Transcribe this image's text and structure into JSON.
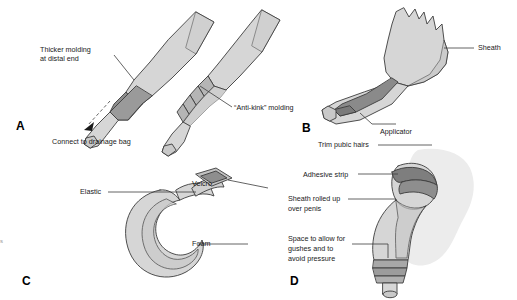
{
  "figure": {
    "background": "#ffffff",
    "style": "grayscale-line-drawing",
    "colors": {
      "outline": "#3c3c3c",
      "light_gray": "#d6d6d6",
      "mid_gray": "#bdbdbd",
      "dark_gray": "#8e8e8e",
      "darker_gray": "#7a7a7a",
      "shadow_gray": "#e6e6e6",
      "label_text": "#1a1a1a"
    },
    "panels": [
      {
        "id": "A",
        "letter": "A",
        "subject": "urinary sheath catheter outlet ends",
        "labels": [
          {
            "name": "thicker-molding",
            "lines": [
              "Thicker molding",
              "at distal end"
            ]
          },
          {
            "name": "anti-kink-molding",
            "lines": [
              "“Anti-kink” molding"
            ]
          },
          {
            "name": "connect-drainage-bag",
            "lines": [
              "Connect to drainage bag"
            ]
          }
        ]
      },
      {
        "id": "B",
        "letter": "B",
        "subject": "sheath with applicator",
        "labels": [
          {
            "name": "sheath",
            "lines": [
              "Sheath"
            ]
          },
          {
            "name": "applicator",
            "lines": [
              "Applicator"
            ]
          }
        ]
      },
      {
        "id": "C",
        "letter": "C",
        "subject": "foam fixing strap",
        "labels": [
          {
            "name": "elastic",
            "lines": [
              "Elastic"
            ]
          },
          {
            "name": "velcro",
            "lines": [
              "Velcro"
            ]
          },
          {
            "name": "foam",
            "lines": [
              "Foam"
            ]
          }
        ]
      },
      {
        "id": "D",
        "letter": "D",
        "subject": "sheath applied over penis",
        "labels": [
          {
            "name": "trim-pubic-hairs",
            "lines": [
              "Trim pubic hairs"
            ]
          },
          {
            "name": "adhesive-strip",
            "lines": [
              "Adhesive strip"
            ]
          },
          {
            "name": "sheath-rolled-up",
            "lines": [
              "Sheath rolled up",
              "over penis"
            ]
          },
          {
            "name": "space-to-allow",
            "lines": [
              "Space to allow for",
              "gushes and to",
              "avoid pressure"
            ]
          }
        ]
      }
    ]
  },
  "edge_artifact": {
    "text": "s"
  }
}
